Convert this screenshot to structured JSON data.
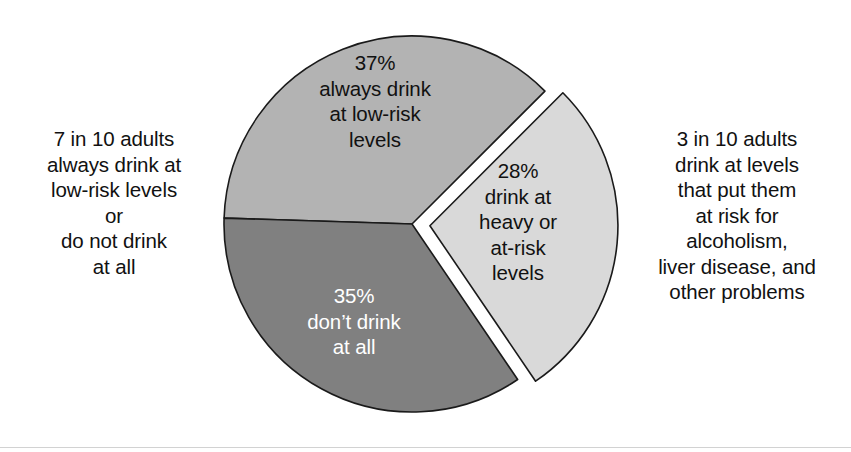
{
  "figure": {
    "background_color": "#ffffff",
    "bottom_rule_color": "#d2d2d2"
  },
  "annotations": {
    "left": {
      "name": "left-annotation",
      "text": "7 in 10 adults\nalways drink at\nlow-risk levels\nor\ndo not drink\nat all"
    },
    "right": {
      "name": "right-annotation",
      "text": "3 in 10 adults\ndrink at levels\nthat put them\nat risk for\nalcoholism,\nliver disease, and\nother problems"
    }
  },
  "slice_labels": {
    "low_risk": "37%\nalways drink\nat low-risk\nlevels",
    "no_drink": "35%\ndon’t drink\nat all",
    "heavy": "28%\ndrink at\nheavy or\nat-risk\nlevels"
  },
  "chart_data": {
    "type": "pie",
    "title": "",
    "subtitle": "",
    "xlabel": "",
    "ylabel": "",
    "grid": false,
    "legend_position": "none",
    "units": "percent",
    "total": 100,
    "center": {
      "x": 412,
      "y": 224
    },
    "radius": 188,
    "start_angle_deg": 45,
    "direction": "counterclockwise",
    "categories": [
      "always drink at low-risk levels",
      "don’t drink at all",
      "drink at heavy or at-risk levels"
    ],
    "values": [
      37,
      35,
      28
    ],
    "labels": [
      "37%",
      "35%",
      "28%"
    ],
    "colors": [
      "#b3b3b3",
      "#808080",
      "#d9d9d9"
    ],
    "text_colors": [
      "#111111",
      "#ffffff",
      "#111111"
    ],
    "exploded": [
      false,
      false,
      true
    ],
    "explode_offset_px": 18,
    "slice_outline_color": "#1a1a1a",
    "slices": [
      {
        "label": "37%",
        "description": "always drink at low-risk levels",
        "value": 37,
        "color": "#b3b3b3",
        "text_color": "#111111",
        "exploded": false,
        "start_angle_deg": 45,
        "end_angle_deg": 178.2
      },
      {
        "label": "35%",
        "description": "don’t drink at all",
        "value": 35,
        "color": "#808080",
        "text_color": "#ffffff",
        "exploded": false,
        "start_angle_deg": 178.2,
        "end_angle_deg": 304.2
      },
      {
        "label": "28%",
        "description": "drink at heavy or at-risk levels",
        "value": 28,
        "color": "#d9d9d9",
        "text_color": "#111111",
        "exploded": true,
        "start_angle_deg": 304.2,
        "end_angle_deg": 405
      }
    ],
    "annotations": [
      {
        "position": "left",
        "text": "7 in 10 adults always drink at low-risk levels or do not drink at all",
        "covers_values": [
          37,
          35
        ]
      },
      {
        "position": "right",
        "text": "3 in 10 adults drink at levels that put them at risk for alcoholism, liver disease, and other problems",
        "covers_values": [
          28
        ]
      }
    ]
  }
}
